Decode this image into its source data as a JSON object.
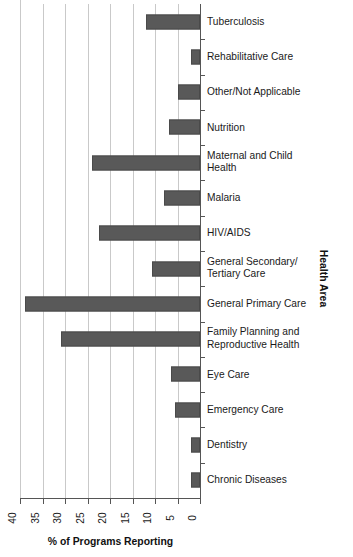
{
  "chart_data": {
    "type": "bar",
    "orientation": "horizontal",
    "title": "",
    "xlabel": "% of Programs Reporting",
    "ylabel": "Health Area",
    "xlim": [
      40,
      0
    ],
    "x_reversed": true,
    "grid": true,
    "legend": "none",
    "xticks": [
      "40",
      "35",
      "30",
      "25",
      "20",
      "15",
      "10",
      "5",
      "0"
    ],
    "xtick_values": [
      40,
      35,
      30,
      25,
      20,
      15,
      10,
      5,
      0
    ],
    "bar_color": "#595959",
    "categories": [
      "Tuberculosis",
      "Rehabilitative Care",
      "Other/Not Applicable",
      "Nutrition",
      "Maternal and Child Health",
      "Malaria",
      "HIV/AIDS",
      "General Secondary/ Tertiary Care",
      "General Primary Care",
      "Family Planning and Reproductive Health",
      "Eye Care",
      "Emergency Care",
      "Dentistry",
      "Chronic Diseases"
    ],
    "values": [
      12.0,
      2.0,
      5.0,
      7.0,
      24.0,
      8.0,
      22.5,
      10.7,
      38.8,
      31.0,
      6.5,
      5.5,
      2.0,
      2.0
    ]
  },
  "labels": {
    "categories": [
      {
        "line1": "Tuberculosis",
        "line2": ""
      },
      {
        "line1": "Rehabilitative Care",
        "line2": ""
      },
      {
        "line1": "Other/Not Applicable",
        "line2": ""
      },
      {
        "line1": "Nutrition",
        "line2": ""
      },
      {
        "line1": "Maternal and Child",
        "line2": "Health"
      },
      {
        "line1": "Malaria",
        "line2": ""
      },
      {
        "line1": "HIV/AIDS",
        "line2": ""
      },
      {
        "line1": "General Secondary/",
        "line2": "Tertiary Care"
      },
      {
        "line1": "General Primary Care",
        "line2": ""
      },
      {
        "line1": "Family Planning and",
        "line2": "Reproductive Health"
      },
      {
        "line1": "Eye Care",
        "line2": ""
      },
      {
        "line1": "Emergency Care",
        "line2": ""
      },
      {
        "line1": "Dentistry",
        "line2": ""
      },
      {
        "line1": "Chronic Diseases",
        "line2": ""
      }
    ]
  }
}
